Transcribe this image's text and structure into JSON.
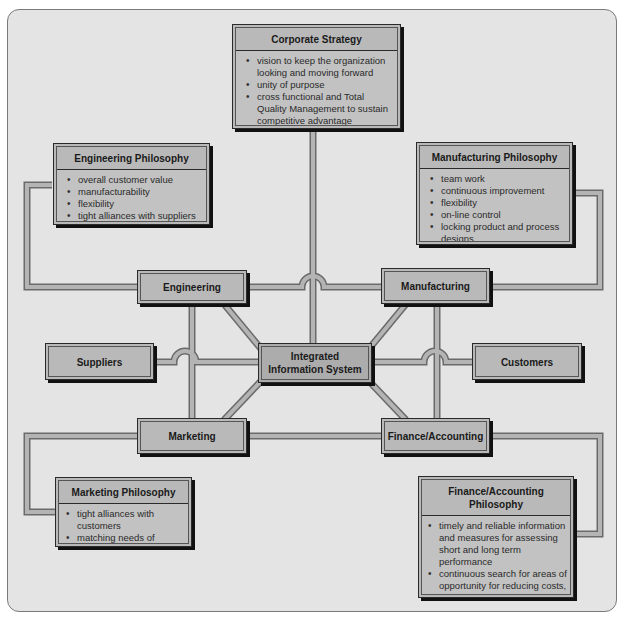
{
  "diagram": {
    "center": {
      "label": "Integrated Information System"
    },
    "nodes": {
      "engineering": {
        "label": "Engineering"
      },
      "manufacturing": {
        "label": "Manufacturing"
      },
      "suppliers": {
        "label": "Suppliers"
      },
      "customers": {
        "label": "Customers"
      },
      "marketing": {
        "label": "Marketing"
      },
      "finance": {
        "label": "Finance/Accounting"
      }
    },
    "philosophies": {
      "corporate": {
        "title": "Corporate Strategy",
        "items": [
          "vision to keep the organization looking and moving forward",
          "unity of purpose",
          "cross functional and Total Quality Management to sustain competitive advantage"
        ]
      },
      "engineering": {
        "title": "Engineering Philosophy",
        "items": [
          "overall customer value",
          "manufacturability",
          "flexibility",
          "tight alliances with suppliers"
        ]
      },
      "manufacturing": {
        "title": "Manufacturing Philosophy",
        "items": [
          "team work",
          "continuous improvement",
          "flexibility",
          "on-line control",
          "locking product and process designs"
        ]
      },
      "marketing": {
        "title": "Marketing Philosophy",
        "items": [
          "tight alliances with customers",
          "matching needs of customers with firm's ability to deliver"
        ]
      },
      "finance": {
        "title": "Finance/Accounting Philosophy",
        "items": [
          "timely and reliable information and measures for assessing short and long term performance",
          "continuous search for areas of opportunity for reducing costs, lead times, and improving quality"
        ]
      }
    },
    "colors": {
      "background": "#e4e4e4",
      "box_fill": "#b9b9b9",
      "connector": "#a9a9a9",
      "outline": "#2a2a2a"
    }
  }
}
